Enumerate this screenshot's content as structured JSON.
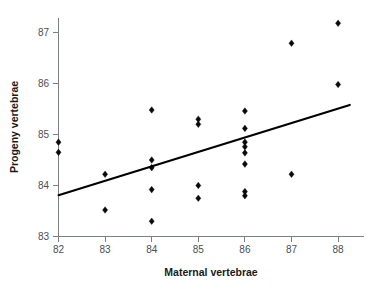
{
  "chart_data": {
    "type": "scatter",
    "title": "",
    "xlabel": "Maternal vertebrae",
    "ylabel": "Progeny vertebrae",
    "xlim": [
      81.6,
      88.4
    ],
    "ylim": [
      82.85,
      87.45
    ],
    "xticks": [
      82,
      83,
      84,
      85,
      86,
      87,
      88
    ],
    "xtick_labels": [
      "82",
      "83",
      "84",
      "85",
      "86",
      "87",
      "88"
    ],
    "yticks": [
      83,
      84,
      85,
      86,
      87
    ],
    "ytick_labels": [
      "83",
      "84",
      "85",
      "86",
      "87"
    ],
    "grid": false,
    "legend": null,
    "marker_style": "diamond",
    "marker_color": "#0a0a0a",
    "points": [
      {
        "x": 82,
        "y": 84.85
      },
      {
        "x": 82,
        "y": 84.65
      },
      {
        "x": 83,
        "y": 84.22
      },
      {
        "x": 83,
        "y": 83.52
      },
      {
        "x": 84,
        "y": 85.48
      },
      {
        "x": 84,
        "y": 84.5
      },
      {
        "x": 84,
        "y": 84.35
      },
      {
        "x": 84,
        "y": 83.92
      },
      {
        "x": 84,
        "y": 83.3
      },
      {
        "x": 85,
        "y": 85.3
      },
      {
        "x": 85,
        "y": 85.2
      },
      {
        "x": 85,
        "y": 84.0
      },
      {
        "x": 85,
        "y": 83.75
      },
      {
        "x": 86,
        "y": 85.46
      },
      {
        "x": 86,
        "y": 85.12
      },
      {
        "x": 86,
        "y": 84.85
      },
      {
        "x": 86,
        "y": 84.76
      },
      {
        "x": 86,
        "y": 84.64
      },
      {
        "x": 86,
        "y": 84.42
      },
      {
        "x": 86,
        "y": 83.88
      },
      {
        "x": 86,
        "y": 83.8
      },
      {
        "x": 87,
        "y": 86.79
      },
      {
        "x": 87,
        "y": 84.22
      },
      {
        "x": 88,
        "y": 87.18
      },
      {
        "x": 88,
        "y": 85.98
      }
    ],
    "fit_line": {
      "type": "linear-regression",
      "x_start": 82.0,
      "y_start": 83.81,
      "x_end": 88.25,
      "y_end": 85.58,
      "color": "#000000"
    }
  }
}
